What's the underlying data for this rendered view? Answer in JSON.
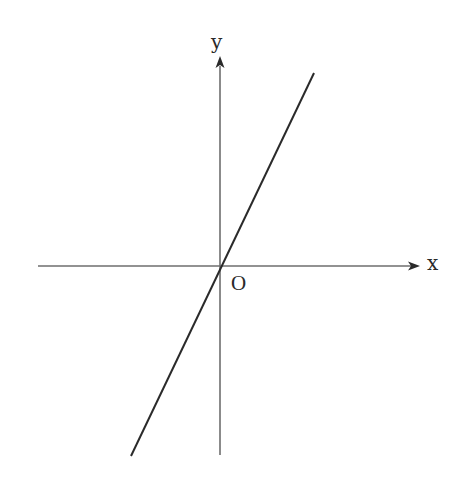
{
  "diagram": {
    "type": "coordinate-axes-with-line",
    "axes": {
      "x_label": "x",
      "y_label": "y",
      "origin_label": "O"
    },
    "line": {
      "description": "straight line through origin with positive slope",
      "passes_through_origin": true,
      "slope_sign": "positive"
    },
    "colors": {
      "axis": "#6e6e6e",
      "line": "#2a2a2a",
      "text": "#2a2a2a",
      "background": "#ffffff"
    }
  }
}
